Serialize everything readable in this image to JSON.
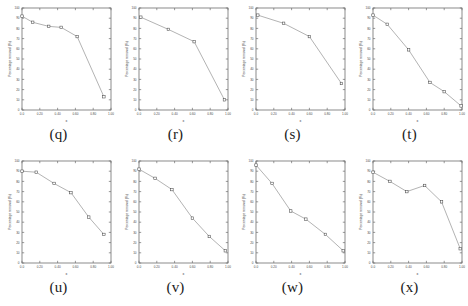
{
  "figure": {
    "background_color": "#ffffff",
    "line_color": "#8a8a8a",
    "marker_edge_color": "#4a4a4a",
    "axis_color": "#6e6e6e",
    "rows": 2,
    "cols": 4
  },
  "chart_data": [
    {
      "type": "line",
      "panel_label": "(q)",
      "title": "",
      "xlabel": "x",
      "ylabel": "Percentage removal (%)",
      "xlim": [
        0.0,
        1.0
      ],
      "ylim": [
        0,
        100
      ],
      "xticks": [
        "0.0",
        "0.20",
        "0.40",
        "0.60",
        "0.80",
        "1.00"
      ],
      "yticks": [
        "0",
        "10",
        "20",
        "30",
        "40",
        "50",
        "60",
        "70",
        "80",
        "90",
        "100"
      ],
      "grid": false,
      "x": [
        0.0,
        0.12,
        0.3,
        0.44,
        0.62,
        0.92
      ],
      "values": [
        92,
        86,
        82,
        81,
        72,
        13
      ]
    },
    {
      "type": "line",
      "panel_label": "(r)",
      "title": "",
      "xlabel": "x",
      "ylabel": "Percentage removal (%)",
      "xlim": [
        0.0,
        1.0
      ],
      "ylim": [
        0,
        100
      ],
      "xticks": [
        "0.0",
        "0.20",
        "0.40",
        "0.60",
        "0.80",
        "1.00"
      ],
      "yticks": [
        "0",
        "10",
        "20",
        "30",
        "40",
        "50",
        "60",
        "70",
        "80",
        "90",
        "100"
      ],
      "grid": false,
      "x": [
        0.02,
        0.33,
        0.62,
        0.96
      ],
      "values": [
        91,
        79,
        67,
        10
      ]
    },
    {
      "type": "line",
      "panel_label": "(s)",
      "title": "",
      "xlabel": "x",
      "ylabel": "Percentage removal (%)",
      "xlim": [
        0.0,
        1.0
      ],
      "ylim": [
        0,
        100
      ],
      "xticks": [
        "0.0",
        "0.20",
        "0.40",
        "0.60",
        "0.80",
        "1.00"
      ],
      "yticks": [
        "0",
        "10",
        "20",
        "30",
        "40",
        "50",
        "60",
        "70",
        "80",
        "90",
        "100"
      ],
      "grid": false,
      "x": [
        0.02,
        0.31,
        0.6,
        0.96
      ],
      "values": [
        93,
        85,
        72,
        26
      ]
    },
    {
      "type": "line",
      "panel_label": "(t)",
      "title": "",
      "xlabel": "x",
      "ylabel": "Percentage removal (%)",
      "xlim": [
        0.0,
        1.0
      ],
      "ylim": [
        0,
        100
      ],
      "xticks": [
        "0.0",
        "0.20",
        "0.40",
        "0.60",
        "0.80",
        "1.00"
      ],
      "yticks": [
        "0",
        "10",
        "20",
        "30",
        "40",
        "50",
        "60",
        "70",
        "80",
        "90",
        "100"
      ],
      "grid": false,
      "x": [
        0.0,
        0.16,
        0.4,
        0.64,
        0.8,
        0.99
      ],
      "values": [
        93,
        84,
        59,
        27,
        18,
        4
      ]
    },
    {
      "type": "line",
      "panel_label": "(u)",
      "title": "",
      "xlabel": "x",
      "ylabel": "Percentage removal (%)",
      "xlim": [
        0.0,
        1.0
      ],
      "ylim": [
        0,
        100
      ],
      "xticks": [
        "0.0",
        "0.20",
        "0.40",
        "0.60",
        "0.80",
        "1.00"
      ],
      "yticks": [
        "0",
        "10",
        "20",
        "30",
        "40",
        "50",
        "60",
        "70",
        "80",
        "90",
        "100"
      ],
      "grid": false,
      "x": [
        0.0,
        0.16,
        0.36,
        0.55,
        0.75,
        0.92
      ],
      "values": [
        90,
        89,
        78,
        69,
        45,
        28
      ]
    },
    {
      "type": "line",
      "panel_label": "(v)",
      "title": "",
      "xlabel": "x",
      "ylabel": "Percentage removal (%)",
      "xlim": [
        0.0,
        1.0
      ],
      "ylim": [
        0,
        100
      ],
      "xticks": [
        "0.0",
        "0.20",
        "0.40",
        "0.60",
        "0.80",
        "1.00"
      ],
      "yticks": [
        "0",
        "10",
        "20",
        "30",
        "40",
        "50",
        "60",
        "70",
        "80",
        "90",
        "100"
      ],
      "grid": false,
      "x": [
        0.0,
        0.18,
        0.37,
        0.6,
        0.79,
        0.97
      ],
      "values": [
        92,
        83,
        72,
        44,
        26,
        12
      ]
    },
    {
      "type": "line",
      "panel_label": "(w)",
      "title": "",
      "xlabel": "x",
      "ylabel": "Percentage removal (%)",
      "xlim": [
        0.0,
        1.0
      ],
      "ylim": [
        0,
        100
      ],
      "xticks": [
        "0.0",
        "0.20",
        "0.40",
        "0.60",
        "0.80",
        "1.00"
      ],
      "yticks": [
        "0",
        "10",
        "20",
        "30",
        "40",
        "50",
        "60",
        "70",
        "80",
        "90",
        "100"
      ],
      "grid": false,
      "x": [
        0.0,
        0.18,
        0.39,
        0.56,
        0.78,
        0.98
      ],
      "values": [
        96,
        78,
        51,
        43,
        28,
        12
      ]
    },
    {
      "type": "line",
      "panel_label": "(x)",
      "title": "",
      "xlabel": "x",
      "ylabel": "Percentage removal (%)",
      "xlim": [
        0.0,
        1.0
      ],
      "ylim": [
        0,
        100
      ],
      "xticks": [
        "0.0",
        "0.20",
        "0.40",
        "0.60",
        "0.80",
        "1.00"
      ],
      "yticks": [
        "0",
        "10",
        "20",
        "30",
        "40",
        "50",
        "60",
        "70",
        "80",
        "90",
        "100"
      ],
      "grid": false,
      "x": [
        0.0,
        0.19,
        0.38,
        0.58,
        0.77,
        0.98
      ],
      "values": [
        89,
        80,
        70,
        76,
        60,
        14
      ]
    }
  ]
}
